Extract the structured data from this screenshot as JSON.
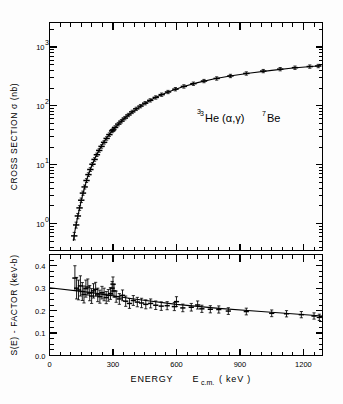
{
  "figure": {
    "annotation": "He (α,γ) Be",
    "annotation_sup_left": "3",
    "annotation_sup_right": "7",
    "background_color": "#fdfdfd",
    "ink_color": "#000000"
  },
  "xaxis": {
    "label_main": "ENERGY",
    "label_symbol": "E",
    "label_sub": "c.m.",
    "label_unit": "( keV )",
    "ticks": [
      0,
      300,
      600,
      900,
      1200
    ],
    "tick_labels": [
      "0",
      "300",
      "600",
      "900",
      "1200"
    ],
    "min": 0,
    "max": 1290
  },
  "upper": {
    "ylabel": "CROSS  SECTION  σ  (nb)",
    "ytick_labels": [
      "10",
      "10",
      "10",
      "10"
    ],
    "ytick_exponents": [
      "0",
      "1",
      "2",
      "3"
    ],
    "ytick_values": [
      1,
      10,
      100,
      1000
    ],
    "ymin": 0.35,
    "ymax": 2600
  },
  "lower": {
    "ylabel": "S(E) - FACTOR (keV-b)",
    "ytick_labels": [
      "0.0",
      "0.1",
      "0.2",
      "0.3",
      "0.4"
    ],
    "ytick_values": [
      0.0,
      0.1,
      0.2,
      0.3,
      0.4
    ],
    "ymin": 0.0,
    "ymax": 0.45
  },
  "chart_data": {
    "type": "scatter",
    "title": "",
    "panels": [
      {
        "name": "cross-section",
        "type": "scatter",
        "xlabel": "ENERGY E_c.m. ( keV )",
        "ylabel": "CROSS SECTION σ (nb)",
        "yscale": "log",
        "xlim": [
          0,
          1290
        ],
        "ylim": [
          0.35,
          2600
        ],
        "grid": false,
        "legend": null,
        "series": [
          {
            "name": "measured cross section",
            "marker": "plus-with-errorbars",
            "points": [
              {
                "x": 117,
                "y": 0.62,
                "yerr": 0.09
              },
              {
                "x": 126,
                "y": 0.95,
                "yerr": 0.11
              },
              {
                "x": 134,
                "y": 1.35,
                "yerr": 0.14
              },
              {
                "x": 142,
                "y": 1.85,
                "yerr": 0.17
              },
              {
                "x": 150,
                "y": 2.5,
                "yerr": 0.22
              },
              {
                "x": 158,
                "y": 3.3,
                "yerr": 0.27
              },
              {
                "x": 166,
                "y": 4.2,
                "yerr": 0.33
              },
              {
                "x": 175,
                "y": 5.4,
                "yerr": 0.4
              },
              {
                "x": 184,
                "y": 6.8,
                "yerr": 0.5
              },
              {
                "x": 193,
                "y": 8.3,
                "yerr": 0.6
              },
              {
                "x": 203,
                "y": 10.2,
                "yerr": 0.7
              },
              {
                "x": 213,
                "y": 12.3,
                "yerr": 0.85
              },
              {
                "x": 224,
                "y": 14.8,
                "yerr": 1.0
              },
              {
                "x": 235,
                "y": 17.5,
                "yerr": 1.2
              },
              {
                "x": 246,
                "y": 20.5,
                "yerr": 1.4
              },
              {
                "x": 258,
                "y": 24.0,
                "yerr": 1.6
              },
              {
                "x": 270,
                "y": 28.0,
                "yerr": 1.9
              },
              {
                "x": 283,
                "y": 32.5,
                "yerr": 2.2
              },
              {
                "x": 296,
                "y": 37.5,
                "yerr": 2.5
              },
              {
                "x": 300,
                "y": 39.0,
                "yerr": 2.6
              },
              {
                "x": 310,
                "y": 43.0,
                "yerr": 2.9
              },
              {
                "x": 325,
                "y": 49.0,
                "yerr": 3.3
              },
              {
                "x": 340,
                "y": 55.0,
                "yerr": 3.7
              },
              {
                "x": 356,
                "y": 62.0,
                "yerr": 4.1
              },
              {
                "x": 373,
                "y": 70.0,
                "yerr": 4.6
              },
              {
                "x": 391,
                "y": 79.0,
                "yerr": 5.2
              },
              {
                "x": 410,
                "y": 89.0,
                "yerr": 5.8
              },
              {
                "x": 430,
                "y": 99.0,
                "yerr": 6.5
              },
              {
                "x": 452,
                "y": 111.0,
                "yerr": 7.2
              },
              {
                "x": 476,
                "y": 124.0,
                "yerr": 8.0
              },
              {
                "x": 502,
                "y": 139.0,
                "yerr": 9.0
              },
              {
                "x": 530,
                "y": 155.0,
                "yerr": 10.0
              },
              {
                "x": 560,
                "y": 172.0,
                "yerr": 11.0
              },
              {
                "x": 595,
                "y": 192.0,
                "yerr": 12.5
              },
              {
                "x": 635,
                "y": 214.0,
                "yerr": 14.0
              },
              {
                "x": 680,
                "y": 238.0,
                "yerr": 15.5
              },
              {
                "x": 730,
                "y": 264.0,
                "yerr": 17.0
              },
              {
                "x": 790,
                "y": 292.0,
                "yerr": 19.0
              },
              {
                "x": 855,
                "y": 322.0,
                "yerr": 21.0
              },
              {
                "x": 930,
                "y": 355.0,
                "yerr": 23.0
              },
              {
                "x": 1010,
                "y": 390.0,
                "yerr": 25.0
              },
              {
                "x": 1090,
                "y": 420.0,
                "yerr": 27.0
              },
              {
                "x": 1160,
                "y": 445.0,
                "yerr": 29.0
              },
              {
                "x": 1230,
                "y": 465.0,
                "yerr": 30.0
              },
              {
                "x": 1270,
                "y": 475.0,
                "yerr": 31.0
              }
            ]
          },
          {
            "name": "fit curve",
            "marker": "line",
            "points": [
              {
                "x": 113,
                "y": 0.52
              },
              {
                "x": 120,
                "y": 0.75
              },
              {
                "x": 130,
                "y": 1.15
              },
              {
                "x": 140,
                "y": 1.7
              },
              {
                "x": 150,
                "y": 2.45
              },
              {
                "x": 165,
                "y": 4.0
              },
              {
                "x": 180,
                "y": 6.2
              },
              {
                "x": 200,
                "y": 9.8
              },
              {
                "x": 220,
                "y": 14.2
              },
              {
                "x": 240,
                "y": 19.5
              },
              {
                "x": 260,
                "y": 25.5
              },
              {
                "x": 280,
                "y": 32.0
              },
              {
                "x": 300,
                "y": 39.0
              },
              {
                "x": 330,
                "y": 51.0
              },
              {
                "x": 360,
                "y": 64.0
              },
              {
                "x": 400,
                "y": 83.0
              },
              {
                "x": 450,
                "y": 110.0
              },
              {
                "x": 500,
                "y": 138.0
              },
              {
                "x": 560,
                "y": 172.0
              },
              {
                "x": 630,
                "y": 211.0
              },
              {
                "x": 700,
                "y": 248.0
              },
              {
                "x": 780,
                "y": 288.0
              },
              {
                "x": 860,
                "y": 324.0
              },
              {
                "x": 950,
                "y": 361.0
              },
              {
                "x": 1050,
                "y": 400.0
              },
              {
                "x": 1150,
                "y": 438.0
              },
              {
                "x": 1280,
                "y": 478.0
              }
            ]
          }
        ]
      },
      {
        "name": "s-factor",
        "type": "scatter",
        "xlabel": "ENERGY E_c.m. ( keV )",
        "ylabel": "S(E) - FACTOR (keV-b)",
        "yscale": "linear",
        "xlim": [
          0,
          1290
        ],
        "ylim": [
          0.0,
          0.45
        ],
        "grid": false,
        "legend": null,
        "series": [
          {
            "name": "S-factor data",
            "marker": "plus-with-errorbars",
            "points": [
              {
                "x": 120,
                "y": 0.345,
                "yerr": 0.055
              },
              {
                "x": 128,
                "y": 0.3,
                "yerr": 0.048
              },
              {
                "x": 137,
                "y": 0.292,
                "yerr": 0.044
              },
              {
                "x": 146,
                "y": 0.31,
                "yerr": 0.045
              },
              {
                "x": 155,
                "y": 0.285,
                "yerr": 0.04
              },
              {
                "x": 163,
                "y": 0.272,
                "yerr": 0.038
              },
              {
                "x": 172,
                "y": 0.298,
                "yerr": 0.038
              },
              {
                "x": 181,
                "y": 0.305,
                "yerr": 0.036
              },
              {
                "x": 190,
                "y": 0.278,
                "yerr": 0.034
              },
              {
                "x": 199,
                "y": 0.265,
                "yerr": 0.033
              },
              {
                "x": 208,
                "y": 0.288,
                "yerr": 0.032
              },
              {
                "x": 218,
                "y": 0.295,
                "yerr": 0.031
              },
              {
                "x": 228,
                "y": 0.27,
                "yerr": 0.03
              },
              {
                "x": 238,
                "y": 0.262,
                "yerr": 0.029
              },
              {
                "x": 248,
                "y": 0.28,
                "yerr": 0.028
              },
              {
                "x": 258,
                "y": 0.272,
                "yerr": 0.028
              },
              {
                "x": 268,
                "y": 0.258,
                "yerr": 0.027
              },
              {
                "x": 278,
                "y": 0.268,
                "yerr": 0.026
              },
              {
                "x": 288,
                "y": 0.276,
                "yerr": 0.026
              },
              {
                "x": 296,
                "y": 0.3,
                "yerr": 0.03
              },
              {
                "x": 300,
                "y": 0.318,
                "yerr": 0.032
              },
              {
                "x": 305,
                "y": 0.288,
                "yerr": 0.028
              },
              {
                "x": 315,
                "y": 0.262,
                "yerr": 0.025
              },
              {
                "x": 330,
                "y": 0.252,
                "yerr": 0.024
              },
              {
                "x": 345,
                "y": 0.268,
                "yerr": 0.024
              },
              {
                "x": 360,
                "y": 0.242,
                "yerr": 0.023
              },
              {
                "x": 378,
                "y": 0.232,
                "yerr": 0.022
              },
              {
                "x": 396,
                "y": 0.245,
                "yerr": 0.022
              },
              {
                "x": 415,
                "y": 0.238,
                "yerr": 0.021
              },
              {
                "x": 435,
                "y": 0.234,
                "yerr": 0.021
              },
              {
                "x": 455,
                "y": 0.228,
                "yerr": 0.02
              },
              {
                "x": 478,
                "y": 0.232,
                "yerr": 0.02
              },
              {
                "x": 502,
                "y": 0.224,
                "yerr": 0.019
              },
              {
                "x": 528,
                "y": 0.22,
                "yerr": 0.019
              },
              {
                "x": 556,
                "y": 0.222,
                "yerr": 0.018
              },
              {
                "x": 590,
                "y": 0.218,
                "yerr": 0.018
              },
              {
                "x": 600,
                "y": 0.24,
                "yerr": 0.022
              },
              {
                "x": 630,
                "y": 0.212,
                "yerr": 0.017
              },
              {
                "x": 670,
                "y": 0.215,
                "yerr": 0.017
              },
              {
                "x": 700,
                "y": 0.225,
                "yerr": 0.018
              },
              {
                "x": 720,
                "y": 0.208,
                "yerr": 0.016
              },
              {
                "x": 760,
                "y": 0.206,
                "yerr": 0.016
              },
              {
                "x": 800,
                "y": 0.205,
                "yerr": 0.016
              },
              {
                "x": 845,
                "y": 0.198,
                "yerr": 0.015
              },
              {
                "x": 930,
                "y": 0.196,
                "yerr": 0.015
              },
              {
                "x": 1050,
                "y": 0.188,
                "yerr": 0.015
              },
              {
                "x": 1120,
                "y": 0.186,
                "yerr": 0.014
              },
              {
                "x": 1190,
                "y": 0.182,
                "yerr": 0.014
              },
              {
                "x": 1250,
                "y": 0.176,
                "yerr": 0.014
              },
              {
                "x": 1275,
                "y": 0.17,
                "yerr": 0.014
              }
            ]
          },
          {
            "name": "fit line",
            "marker": "line",
            "points": [
              {
                "x": 0,
                "y": 0.302
              },
              {
                "x": 200,
                "y": 0.28
              },
              {
                "x": 400,
                "y": 0.252
              },
              {
                "x": 600,
                "y": 0.228
              },
              {
                "x": 800,
                "y": 0.21
              },
              {
                "x": 1000,
                "y": 0.196
              },
              {
                "x": 1290,
                "y": 0.176
              }
            ]
          }
        ]
      }
    ]
  }
}
